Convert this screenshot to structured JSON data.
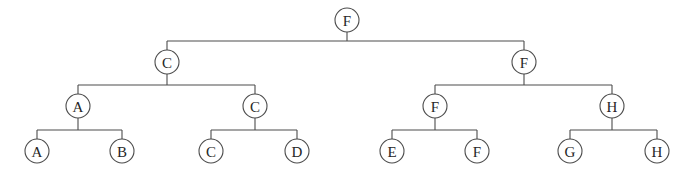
{
  "diagram": {
    "type": "binary-tree",
    "width": 688,
    "height": 186,
    "background_color": "#ffffff",
    "stroke_color": "#4c4c4c",
    "label_color": "#262626",
    "node_radius": 12,
    "levels": 4,
    "node_count": 15
  },
  "nodes": [
    {
      "id": "n0",
      "label": "F",
      "level": 0,
      "x": 347,
      "y": 20,
      "parent": null,
      "side": "root"
    },
    {
      "id": "n1",
      "label": "C",
      "level": 1,
      "x": 167,
      "y": 62,
      "parent": "n0",
      "side": "left"
    },
    {
      "id": "n2",
      "label": "F",
      "level": 1,
      "x": 524,
      "y": 62,
      "parent": "n0",
      "side": "right"
    },
    {
      "id": "n3",
      "label": "A",
      "level": 2,
      "x": 78,
      "y": 106,
      "parent": "n1",
      "side": "left"
    },
    {
      "id": "n4",
      "label": "C",
      "level": 2,
      "x": 255,
      "y": 106,
      "parent": "n1",
      "side": "right"
    },
    {
      "id": "n5",
      "label": "F",
      "level": 2,
      "x": 435,
      "y": 106,
      "parent": "n2",
      "side": "left"
    },
    {
      "id": "n6",
      "label": "H",
      "level": 2,
      "x": 612,
      "y": 106,
      "parent": "n2",
      "side": "right"
    },
    {
      "id": "n7",
      "label": "A",
      "level": 3,
      "x": 37,
      "y": 151,
      "parent": "n3",
      "side": "left"
    },
    {
      "id": "n8",
      "label": "B",
      "level": 3,
      "x": 122,
      "y": 151,
      "parent": "n3",
      "side": "right"
    },
    {
      "id": "n9",
      "label": "C",
      "level": 3,
      "x": 211,
      "y": 151,
      "parent": "n4",
      "side": "left"
    },
    {
      "id": "n10",
      "label": "D",
      "level": 3,
      "x": 297,
      "y": 151,
      "parent": "n4",
      "side": "right"
    },
    {
      "id": "n11",
      "label": "E",
      "level": 3,
      "x": 392,
      "y": 151,
      "parent": "n5",
      "side": "left"
    },
    {
      "id": "n12",
      "label": "F",
      "level": 3,
      "x": 477,
      "y": 151,
      "parent": "n5",
      "side": "right"
    },
    {
      "id": "n13",
      "label": "G",
      "level": 3,
      "x": 570,
      "y": 151,
      "parent": "n6",
      "side": "left"
    },
    {
      "id": "n14",
      "label": "H",
      "level": 3,
      "x": 657,
      "y": 151,
      "parent": "n6",
      "side": "right"
    }
  ],
  "connectors": [
    {
      "id": "c0",
      "parent": "n0",
      "bar_y": 41,
      "parent_x": 347,
      "left_x": 167,
      "right_x": 524,
      "parent_bottom_y": 32,
      "child_top_y": 50
    },
    {
      "id": "c1",
      "parent": "n1",
      "bar_y": 85,
      "parent_x": 167,
      "left_x": 78,
      "right_x": 255,
      "parent_bottom_y": 74,
      "child_top_y": 94
    },
    {
      "id": "c2",
      "parent": "n2",
      "bar_y": 85,
      "parent_x": 524,
      "left_x": 435,
      "right_x": 612,
      "parent_bottom_y": 74,
      "child_top_y": 94
    },
    {
      "id": "c3",
      "parent": "n3",
      "bar_y": 130,
      "parent_x": 78,
      "left_x": 37,
      "right_x": 122,
      "parent_bottom_y": 118,
      "child_top_y": 139
    },
    {
      "id": "c4",
      "parent": "n4",
      "bar_y": 130,
      "parent_x": 255,
      "left_x": 211,
      "right_x": 297,
      "parent_bottom_y": 118,
      "child_top_y": 139
    },
    {
      "id": "c5",
      "parent": "n5",
      "bar_y": 130,
      "parent_x": 435,
      "left_x": 392,
      "right_x": 477,
      "parent_bottom_y": 118,
      "child_top_y": 139
    },
    {
      "id": "c6",
      "parent": "n6",
      "bar_y": 130,
      "parent_x": 612,
      "left_x": 570,
      "right_x": 657,
      "parent_bottom_y": 118,
      "child_top_y": 139
    }
  ]
}
